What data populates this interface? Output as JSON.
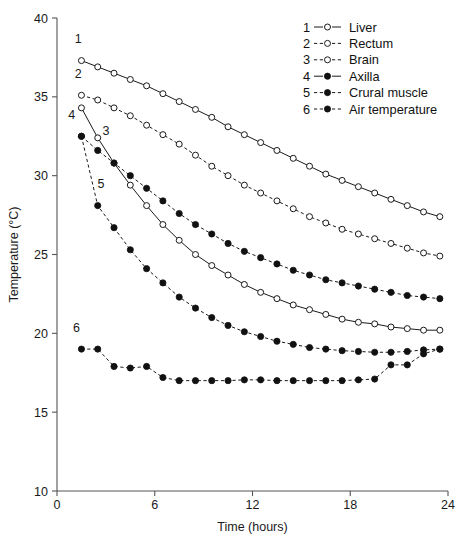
{
  "chart_data": {
    "type": "line",
    "title": "",
    "xlabel": "Time (hours)",
    "ylabel": "Temperature (°C)",
    "xlim": [
      0,
      24
    ],
    "ylim": [
      10,
      40
    ],
    "xticks": [
      0,
      6,
      12,
      18,
      24
    ],
    "yticks": [
      10,
      15,
      20,
      25,
      30,
      35,
      40
    ],
    "xtick_labels": [
      "0",
      "6",
      "12",
      "18",
      "24"
    ],
    "ytick_labels": [
      "10",
      "15",
      "20",
      "25",
      "30",
      "35",
      "40"
    ],
    "grid": false,
    "legend_position": "top-right",
    "series": [
      {
        "number": "1",
        "name": "Liver",
        "marker": "open-circle",
        "line": "solid",
        "color": "#111111",
        "x": [
          1.5,
          2.5,
          3.5,
          4.5,
          5.5,
          6.5,
          7.5,
          8.5,
          9.5,
          10.5,
          11.5,
          12.5,
          13.5,
          14.5,
          15.5,
          16.5,
          17.5,
          18.5,
          19.5,
          20.5,
          21.5,
          22.5,
          23.5
        ],
        "y": [
          37.3,
          36.9,
          36.5,
          36.1,
          35.7,
          35.2,
          34.7,
          34.2,
          33.7,
          33.1,
          32.6,
          32.1,
          31.6,
          31.1,
          30.6,
          30.1,
          29.7,
          29.3,
          28.9,
          28.5,
          28.1,
          27.7,
          27.4
        ]
      },
      {
        "number": "2",
        "name": "Rectum",
        "marker": "open-circle",
        "line": "dashed",
        "color": "#111111",
        "x": [
          1.5,
          2.5,
          3.5,
          4.5,
          5.5,
          6.5,
          7.5,
          8.5,
          9.5,
          10.5,
          11.5,
          12.5,
          13.5,
          14.5,
          15.5,
          16.5,
          17.5,
          18.5,
          19.5,
          20.5,
          21.5,
          22.5,
          23.5
        ],
        "y": [
          35.1,
          34.8,
          34.3,
          33.8,
          33.2,
          32.6,
          32.0,
          31.3,
          30.6,
          30.0,
          29.4,
          28.9,
          28.4,
          27.9,
          27.4,
          27.0,
          26.6,
          26.3,
          26.0,
          25.7,
          25.4,
          25.1,
          24.9
        ]
      },
      {
        "number": "3",
        "name": "Brain",
        "marker": "open-circle",
        "line": "solid",
        "color": "#111111",
        "x": [
          1.5,
          2.5,
          3.5,
          4.5,
          5.5,
          6.5,
          7.5,
          8.5,
          9.5,
          10.5,
          11.5,
          12.5,
          13.5,
          14.5,
          15.5,
          16.5,
          17.5,
          18.5,
          19.5,
          20.5,
          21.5,
          22.5,
          23.5
        ],
        "y": [
          34.3,
          32.4,
          30.8,
          29.4,
          28.1,
          26.9,
          25.9,
          25.0,
          24.3,
          23.7,
          23.1,
          22.6,
          22.2,
          21.8,
          21.5,
          21.2,
          20.9,
          20.7,
          20.6,
          20.4,
          20.3,
          20.2,
          20.2
        ]
      },
      {
        "number": "4",
        "name": "Axilla",
        "marker": "filled-circle",
        "line": "dashed",
        "color": "#111111",
        "x": [
          1.5,
          2.5,
          3.5,
          4.5,
          5.5,
          6.5,
          7.5,
          8.5,
          9.5,
          10.5,
          11.5,
          12.5,
          13.5,
          14.5,
          15.5,
          16.5,
          17.5,
          18.5,
          19.5,
          20.5,
          21.5,
          22.5,
          23.5
        ],
        "y": [
          32.5,
          31.6,
          30.8,
          30.0,
          29.2,
          28.4,
          27.6,
          26.9,
          26.3,
          25.7,
          25.2,
          24.8,
          24.4,
          24.0,
          23.7,
          23.4,
          23.2,
          23.0,
          22.8,
          22.6,
          22.4,
          22.3,
          22.2
        ]
      },
      {
        "number": "5",
        "name": "Crural muscle",
        "marker": "filled-circle",
        "line": "dashed",
        "color": "#111111",
        "x": [
          1.5,
          2.5,
          3.5,
          4.5,
          5.5,
          6.5,
          7.5,
          8.5,
          9.5,
          10.5,
          11.5,
          12.5,
          13.5,
          14.5,
          15.5,
          16.5,
          17.5,
          18.5,
          19.5,
          20.5,
          21.5,
          22.5,
          23.5
        ],
        "y": [
          32.5,
          28.1,
          26.7,
          25.3,
          24.1,
          23.2,
          22.3,
          21.6,
          21.0,
          20.5,
          20.1,
          19.8,
          19.5,
          19.3,
          19.1,
          19.0,
          18.9,
          18.85,
          18.8,
          18.8,
          18.85,
          18.95,
          19.0
        ]
      },
      {
        "number": "6",
        "name": "Air temperature",
        "marker": "filled-circle",
        "line": "dashed",
        "color": "#111111",
        "x": [
          1.5,
          2.5,
          3.5,
          4.5,
          5.5,
          6.5,
          7.5,
          8.5,
          9.5,
          10.5,
          11.5,
          12.5,
          13.5,
          14.5,
          15.5,
          16.5,
          17.5,
          18.5,
          19.5,
          20.5,
          21.5,
          22.5,
          23.5
        ],
        "y": [
          19.0,
          19.0,
          17.9,
          17.8,
          17.9,
          17.2,
          17.0,
          17.0,
          17.0,
          17.0,
          17.05,
          17.05,
          17.0,
          17.0,
          17.0,
          17.0,
          17.0,
          17.05,
          17.1,
          18.0,
          18.0,
          18.7,
          19.0
        ]
      }
    ],
    "curve_labels": [
      {
        "text": "1",
        "x": 1.3,
        "y": 38.4
      },
      {
        "text": "2",
        "x": 1.3,
        "y": 36.2
      },
      {
        "text": "3",
        "x": 3.0,
        "y": 32.6
      },
      {
        "text": "4",
        "x": 0.9,
        "y": 33.6
      },
      {
        "text": "5",
        "x": 2.7,
        "y": 29.2
      },
      {
        "text": "6",
        "x": 1.2,
        "y": 20.1
      }
    ]
  },
  "legend": {
    "entries": [
      {
        "number": "1",
        "label": "Liver",
        "marker": "open-circle",
        "line": "solid"
      },
      {
        "number": "2",
        "label": "Rectum",
        "marker": "open-circle",
        "line": "dashed"
      },
      {
        "number": "3",
        "label": "Brain",
        "marker": "open-circle",
        "line": "dashed"
      },
      {
        "number": "4",
        "label": "Axilla",
        "marker": "filled-circle",
        "line": "solid"
      },
      {
        "number": "5",
        "label": "Crural muscle",
        "marker": "filled-circle",
        "line": "dashed"
      },
      {
        "number": "6",
        "label": "Air temperature",
        "marker": "filled-circle",
        "line": "dashed"
      }
    ]
  }
}
